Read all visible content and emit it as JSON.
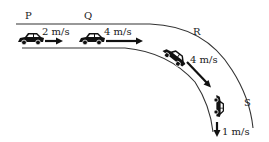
{
  "diagram": {
    "points": [
      {
        "id": "P",
        "label": "P"
      },
      {
        "id": "Q",
        "label": "Q"
      },
      {
        "id": "R",
        "label": "R"
      },
      {
        "id": "S",
        "label": "S"
      }
    ],
    "velocities": [
      {
        "at": "P",
        "label": "2 m/s"
      },
      {
        "at": "Q",
        "label": "4 m/s"
      },
      {
        "at": "R",
        "label": "4 m/s"
      },
      {
        "at": "S",
        "label": "1 m/s"
      }
    ],
    "colors": {
      "line": "#333333",
      "car": "#111111",
      "background": "#ffffff"
    }
  }
}
